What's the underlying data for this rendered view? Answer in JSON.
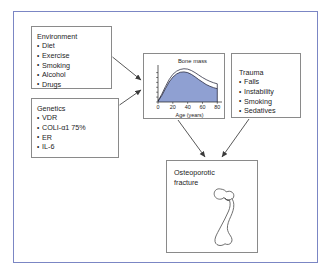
{
  "figure": {
    "frame_color": "#7b86c4",
    "box_border_color": "#8a8a8a",
    "text_color": "#1d1d1d",
    "arrow_color": "#3a3a3a",
    "background": "#ffffff"
  },
  "boxes": {
    "environment": {
      "title": "Environment",
      "items": [
        "Diet",
        "Exercise",
        "Smoking",
        "Alcohol",
        "Drugs"
      ]
    },
    "genetics": {
      "title": "Genetics",
      "items": [
        "VDR",
        "COLI-α1  75%",
        "ER",
        "IL-6"
      ]
    },
    "trauma": {
      "title": "Trauma",
      "items": [
        "Falls",
        "Instability",
        "Smoking",
        "Sedatives"
      ]
    },
    "fracture": {
      "title_line1": "Osteoporotic",
      "title_line2": "fracture",
      "illustration": "femur-bone-icon"
    }
  },
  "chart_data": {
    "type": "area",
    "title": "Bone mass",
    "xlabel": "Age (years)",
    "ylabel": "",
    "x": [
      0,
      5,
      10,
      15,
      20,
      25,
      30,
      35,
      40,
      45,
      50,
      55,
      60,
      65,
      70,
      75,
      80
    ],
    "xlim": [
      0,
      85
    ],
    "ylim": [
      0,
      100
    ],
    "xticks": [
      0,
      20,
      40,
      60,
      80
    ],
    "xticklabels": [
      "0",
      "20",
      "40",
      "60",
      "80"
    ],
    "yticks": [
      0,
      14,
      28,
      42,
      56,
      70,
      84
    ],
    "yticklabels": [
      "",
      "",
      "",
      "",
      "",
      "",
      ""
    ],
    "grid": false,
    "legend": false,
    "fill_color": "#8fa0d2",
    "line_color": "#23243a",
    "series": [
      {
        "name": "Peak bone mass (upper envelope)",
        "values": [
          3,
          22,
          44,
          64,
          79,
          88,
          93,
          95,
          94,
          90,
          84,
          77,
          70,
          64,
          59,
          55,
          52
        ]
      },
      {
        "name": "Bone mass (filled area)",
        "values": [
          2,
          18,
          38,
          57,
          71,
          80,
          85,
          86,
          84,
          79,
          72,
          64,
          57,
          50,
          45,
          41,
          38
        ]
      }
    ]
  },
  "arrows": [
    {
      "name": "environment-to-chart",
      "from": "environment",
      "to": "chart"
    },
    {
      "name": "genetics-to-chart",
      "from": "genetics",
      "to": "chart"
    },
    {
      "name": "chart-to-fracture",
      "from": "chart",
      "to": "fracture"
    },
    {
      "name": "trauma-to-fracture",
      "from": "trauma",
      "to": "fracture"
    }
  ]
}
